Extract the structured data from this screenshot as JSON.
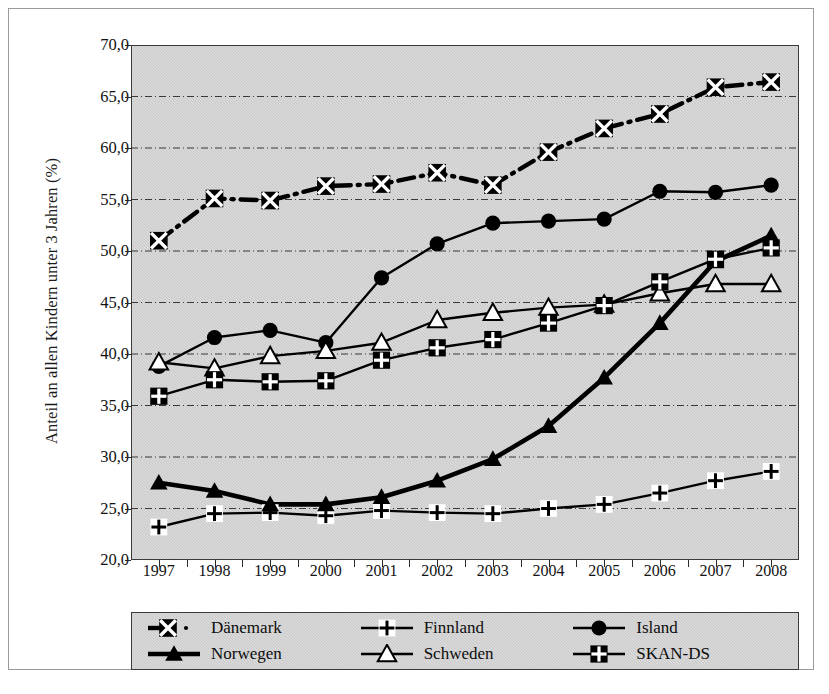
{
  "chart_data": {
    "type": "line",
    "title": "",
    "subtitle": "",
    "xlabel": "",
    "ylabel": "Anteil an allen Kindern unter 3 Jahren (%)",
    "categories": [
      "1997",
      "1998",
      "1999",
      "2000",
      "2001",
      "2002",
      "2003",
      "2004",
      "2005",
      "2006",
      "2007",
      "2008"
    ],
    "x": [
      1997,
      1998,
      1999,
      2000,
      2001,
      2002,
      2003,
      2004,
      2005,
      2006,
      2007,
      2008
    ],
    "ylim": [
      20.0,
      70.0
    ],
    "ytick_values": [
      70.0,
      65.0,
      60.0,
      55.0,
      50.0,
      45.0,
      40.0,
      35.0,
      30.0,
      25.0,
      20.0
    ],
    "ytick_labels": [
      "70,0",
      "65,0",
      "60,0",
      "55,0",
      "50,0",
      "45,0",
      "40,0",
      "35,0",
      "30,0",
      "25,0",
      "20,0"
    ],
    "ystep": 5.0,
    "grid": true,
    "grid_style": "dash-dot horizontal",
    "legend_position": "bottom",
    "plot_background": "#c9c9c9",
    "series": [
      {
        "name": "Dänemark",
        "marker": "x-in-square",
        "line_style": "dash-dot",
        "color": "#000000",
        "values": [
          51.0,
          55.1,
          54.9,
          56.3,
          56.5,
          57.6,
          56.4,
          59.6,
          61.9,
          63.3,
          65.9,
          66.4
        ]
      },
      {
        "name": "Finnland",
        "marker": "plus-in-white-square",
        "line_style": "solid",
        "color": "#000000",
        "values": [
          23.2,
          24.5,
          24.6,
          24.3,
          24.8,
          24.6,
          24.5,
          25.0,
          25.4,
          26.5,
          27.7,
          28.6
        ]
      },
      {
        "name": "Island",
        "marker": "filled-circle",
        "line_style": "solid",
        "color": "#000000",
        "values": [
          38.8,
          41.6,
          42.3,
          41.1,
          47.4,
          50.7,
          52.7,
          52.9,
          53.1,
          55.8,
          55.7,
          56.4
        ]
      },
      {
        "name": "Norwegen",
        "marker": "filled-triangle",
        "line_style": "solid-thick",
        "color": "#000000",
        "values": [
          27.5,
          26.7,
          25.4,
          25.4,
          26.1,
          27.7,
          29.8,
          33.0,
          37.7,
          43.0,
          49.0,
          51.5
        ]
      },
      {
        "name": "Schweden",
        "marker": "open-triangle",
        "line_style": "solid",
        "color": "#000000",
        "values": [
          39.2,
          38.6,
          39.8,
          40.3,
          41.1,
          43.3,
          44.0,
          44.5,
          44.8,
          45.9,
          46.8,
          46.8
        ]
      },
      {
        "name": "SKAN-DS",
        "marker": "plus-in-black-square",
        "line_style": "solid",
        "color": "#000000",
        "values": [
          35.9,
          37.5,
          37.3,
          37.4,
          39.4,
          40.6,
          41.4,
          43.0,
          44.7,
          47.0,
          49.2,
          50.3
        ]
      }
    ]
  },
  "legend": {
    "items": [
      {
        "label": "Dänemark",
        "marker": "x-in-square"
      },
      {
        "label": "Finnland",
        "marker": "plus-in-white-square"
      },
      {
        "label": "Island",
        "marker": "filled-circle"
      },
      {
        "label": "Norwegen",
        "marker": "filled-triangle"
      },
      {
        "label": "Schweden",
        "marker": "open-triangle"
      },
      {
        "label": "SKAN-DS",
        "marker": "plus-in-black-square"
      }
    ]
  }
}
